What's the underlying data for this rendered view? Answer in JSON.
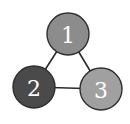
{
  "graph": {
    "nodes": [
      {
        "id": "1",
        "label": "1",
        "cx": 68,
        "cy": 34,
        "r": 21,
        "fill": "#8c8c8c"
      },
      {
        "id": "2",
        "label": "2",
        "cx": 34,
        "cy": 87,
        "r": 21,
        "fill": "#4a4a4a"
      },
      {
        "id": "3",
        "label": "3",
        "cx": 101,
        "cy": 89,
        "r": 21,
        "fill": "#a0a0a0"
      }
    ],
    "edges": [
      {
        "from": "1",
        "to": "2"
      },
      {
        "from": "1",
        "to": "3"
      },
      {
        "from": "2",
        "to": "3"
      }
    ],
    "edge_color": "#2a2a2a"
  }
}
